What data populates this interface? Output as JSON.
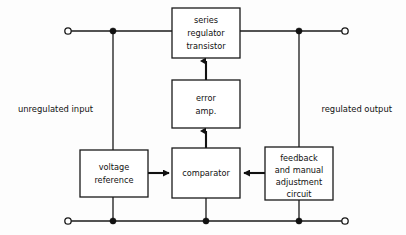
{
  "diagram": {
    "type": "block-diagram",
    "canvas": {
      "width": 406,
      "height": 235
    },
    "colors": {
      "background": "#fdfdfd",
      "stroke": "#1a1a1a",
      "arrow": "#111111",
      "box_fill": "#ffffff",
      "text": "#111111"
    }
  },
  "blocks": {
    "series_regulator": {
      "lines": [
        "series",
        "regulator",
        "transistor"
      ],
      "line1": "series",
      "line2": "regulator",
      "line3": "transistor"
    },
    "error_amp": {
      "lines": [
        "error",
        "amp."
      ],
      "line1": "error",
      "line2": "amp."
    },
    "comparator": {
      "lines": [
        "comparator"
      ],
      "line1": "comparator"
    },
    "voltage_reference": {
      "lines": [
        "voltage",
        "reference"
      ],
      "line1": "voltage",
      "line2": "reference"
    },
    "feedback_circuit": {
      "lines": [
        "feedback",
        "and manual",
        "adjustment",
        "circuit"
      ],
      "line1": "feedback",
      "line2": "and manual",
      "line3": "adjustment",
      "line4": "circuit"
    }
  },
  "rail_labels": {
    "input": "unregulated input",
    "output": "regulated output"
  },
  "terminals": {
    "input_top": "open-terminal",
    "input_bottom": "open-terminal",
    "output_top": "open-terminal",
    "output_bottom": "open-terminal"
  },
  "signal_flow": [
    {
      "from": "voltage_reference",
      "to": "comparator",
      "direction": "right"
    },
    {
      "from": "feedback_circuit",
      "to": "comparator",
      "direction": "left"
    },
    {
      "from": "comparator",
      "to": "error_amp",
      "direction": "up"
    },
    {
      "from": "error_amp",
      "to": "series_regulator",
      "direction": "up"
    }
  ]
}
